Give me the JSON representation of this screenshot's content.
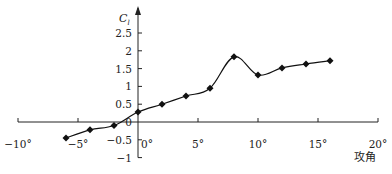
{
  "chart_data": {
    "type": "line",
    "title": "",
    "xlabel": "攻角",
    "ylabel": "C_l",
    "ylabel_main": "C",
    "ylabel_sub": "l",
    "x_ticks": [
      -10,
      -5,
      0,
      5,
      10,
      15,
      20
    ],
    "x_tick_labels": [
      "−10°",
      "−5°",
      "0°",
      "5°",
      "10°",
      "15°",
      "20°"
    ],
    "y_ticks": [
      -1,
      -0.5,
      0,
      0.5,
      1,
      1.5,
      2,
      2.5
    ],
    "y_tick_labels": [
      "−1",
      "−0.5",
      "0",
      "0.5",
      "1",
      "1.5",
      "2",
      "2.5"
    ],
    "xlim": [
      -10,
      20
    ],
    "ylim": [
      -1,
      2.9
    ],
    "grid": false,
    "legend": null,
    "series": [
      {
        "name": "C_l",
        "marker": "diamond",
        "x": [
          -6,
          -4,
          -2,
          0,
          2,
          4,
          6,
          8,
          10,
          12,
          14,
          16
        ],
        "values": [
          -0.45,
          -0.22,
          -0.1,
          0.28,
          0.5,
          0.73,
          0.95,
          1.83,
          1.32,
          1.52,
          1.63,
          1.72
        ]
      }
    ]
  }
}
